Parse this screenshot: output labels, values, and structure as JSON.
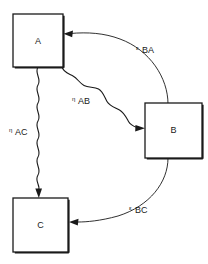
{
  "diagram": {
    "background_color": "#ffffff",
    "stroke_color": "#1a1a1a",
    "nodes": [
      {
        "id": "A",
        "label": "A",
        "x": 13,
        "y": 14,
        "w": 50,
        "h": 53
      },
      {
        "id": "B",
        "label": "B",
        "x": 145,
        "y": 103,
        "w": 57,
        "h": 55
      },
      {
        "id": "C",
        "label": "C",
        "x": 13,
        "y": 198,
        "w": 55,
        "h": 54
      }
    ],
    "edges": [
      {
        "id": "eta-AB",
        "from": "A",
        "to": "B",
        "style": "wavy",
        "symbol": "η",
        "subscript": "AB",
        "label_x": 72,
        "label_y": 104
      },
      {
        "id": "eta-AC",
        "from": "A",
        "to": "C",
        "style": "wavy",
        "symbol": "η",
        "subscript": "AC",
        "label_x": 9,
        "label_y": 135
      },
      {
        "id": "epsilon-BA",
        "from": "B",
        "to": "A",
        "style": "curve",
        "symbol": "ε",
        "subscript": "BA",
        "label_x": 136,
        "label_y": 53
      },
      {
        "id": "epsilon-BC",
        "from": "B",
        "to": "C",
        "style": "curve",
        "symbol": "ε",
        "subscript": "BC",
        "label_x": 129,
        "label_y": 213
      }
    ]
  }
}
